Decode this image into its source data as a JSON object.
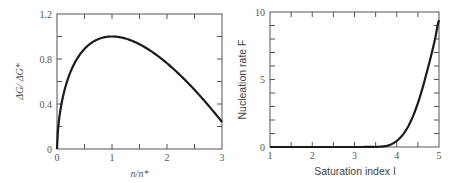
{
  "chart_data": [
    {
      "type": "line",
      "title": "",
      "xlabel": "n/n*",
      "ylabel": "ΔG/ ΔG*",
      "xlim": [
        0,
        3
      ],
      "ylim": [
        0,
        1.2
      ],
      "x_ticks": [
        "0",
        "1",
        "2",
        "3"
      ],
      "y_ticks": [
        "0",
        "0.4",
        "0.8",
        "1.2"
      ],
      "grid": false,
      "legend": null,
      "series": [
        {
          "name": "ΔG/ΔG*",
          "x": [
            0,
            0.05,
            0.1,
            0.2,
            0.3,
            0.4,
            0.5,
            0.6,
            0.8,
            1.0,
            1.25,
            1.5,
            1.75,
            2.0,
            2.25,
            2.5,
            2.75,
            3.0
          ],
          "y": [
            0,
            0.31,
            0.45,
            0.63,
            0.74,
            0.83,
            0.89,
            0.94,
            0.99,
            1.0,
            0.98,
            0.93,
            0.85,
            0.76,
            0.64,
            0.52,
            0.38,
            0.24
          ]
        }
      ]
    },
    {
      "type": "line",
      "title": "",
      "xlabel": "Saturation index I",
      "ylabel": "Nucleation rate F",
      "xlim": [
        1,
        5
      ],
      "ylim": [
        0,
        10
      ],
      "x_ticks": [
        "1",
        "2",
        "3",
        "4",
        "5"
      ],
      "y_ticks": [
        "0",
        "5",
        "10"
      ],
      "grid": false,
      "legend": null,
      "series": [
        {
          "name": "F",
          "x": [
            1,
            2,
            3,
            3.5,
            3.7,
            3.8,
            3.9,
            4.0,
            4.1,
            4.2,
            4.3,
            4.4,
            4.5,
            4.6,
            4.7,
            4.8,
            4.9,
            5.0
          ],
          "y": [
            0,
            0,
            0,
            0.01,
            0.05,
            0.12,
            0.25,
            0.45,
            0.75,
            1.15,
            1.7,
            2.4,
            3.25,
            4.25,
            5.4,
            6.6,
            7.9,
            9.4
          ]
        }
      ]
    }
  ]
}
